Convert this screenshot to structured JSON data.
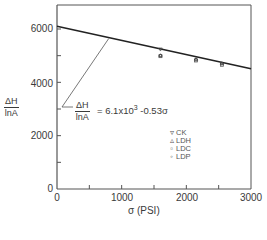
{
  "chart_data": {
    "type": "scatter",
    "title": "",
    "xlabel": "σ (PSI)",
    "ylabel": "ΔH / lnA",
    "xlim": [
      0,
      3000
    ],
    "ylim": [
      0,
      7000
    ],
    "x_ticks": [
      0,
      500,
      1000,
      1500,
      2000,
      2500,
      3000
    ],
    "x_tick_labels": [
      "0",
      "",
      "1000",
      "",
      "2000",
      "",
      "3000"
    ],
    "y_ticks": [
      0,
      1000,
      2000,
      3000,
      4000,
      5000,
      6000
    ],
    "y_tick_labels": [
      "0",
      "",
      "2000",
      "",
      "4000",
      "",
      "6000"
    ],
    "grid": false,
    "fit_line": {
      "equation_label": "ΔH/lnA = 6.1x10^3 - 0.53σ",
      "intercept": 6100,
      "slope": -0.53,
      "x": [
        0,
        3000
      ],
      "y": [
        6100,
        4510
      ]
    },
    "series": [
      {
        "name": "CK",
        "marker": "triangle-down",
        "points": [
          [
            1600,
            5230
          ]
        ]
      },
      {
        "name": "LDH",
        "marker": "triangle-up",
        "points": [
          [
            1600,
            5020
          ],
          [
            2150,
            4880
          ],
          [
            2550,
            4720
          ]
        ]
      },
      {
        "name": "LDC",
        "marker": "square",
        "points": [
          [
            1600,
            4980
          ],
          [
            2150,
            4820
          ],
          [
            2550,
            4660
          ]
        ]
      },
      {
        "name": "LDP",
        "marker": "circle",
        "points": [
          [
            1600,
            5000
          ],
          [
            2150,
            4850
          ],
          [
            2550,
            4700
          ]
        ]
      }
    ],
    "legend_position": "inside-center-right",
    "annotations": [
      {
        "text": "ΔH/lnA = 6.1x10^3 - 0.53σ",
        "arrow_to": [
          800,
          5680
        ]
      }
    ]
  },
  "axis": {
    "y_labels": [
      "6000",
      "4000",
      "2000",
      "0"
    ],
    "x_labels": [
      "0",
      "1000",
      "2000",
      "3000"
    ],
    "x_title": "σ (PSI)",
    "y_title_num": "ΔH",
    "y_title_den": "lnA"
  },
  "equation": {
    "num": "ΔH",
    "den": "lnA",
    "rest_pre": "= 6.1x10",
    "rest_exp": "3",
    "rest_post": " -0.53σ"
  },
  "legend": [
    {
      "symbol": "▿",
      "label": "CK"
    },
    {
      "symbol": "▵",
      "label": "LDH"
    },
    {
      "symbol": "▫",
      "label": "LDC"
    },
    {
      "symbol": "◦",
      "label": "LDP"
    }
  ]
}
